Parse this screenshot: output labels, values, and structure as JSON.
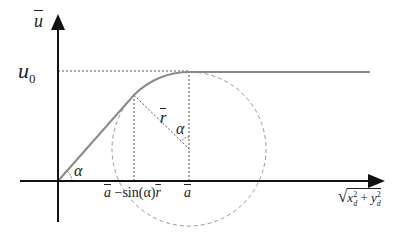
{
  "diagram": {
    "colors": {
      "axis": "#111111",
      "curve": "#8a8a8a",
      "dotted": "#555555",
      "circle": "#9a9a9a",
      "text": "#222222"
    },
    "labels": {
      "y_axis": "u",
      "u0_main": "u",
      "u0_sub": "0",
      "alpha_origin": "α",
      "alpha_center": "α",
      "r_bar": "r",
      "x_tick_left_a": "a",
      "x_tick_left_rest": " −sin(α)",
      "x_tick_left_r": "r",
      "x_tick_right": "a",
      "x_axis_sqrt": "√",
      "x_axis_x": "x",
      "x_axis_x_sup": "2",
      "x_axis_x_sub": "d",
      "x_axis_plus": " + ",
      "x_axis_y": "y",
      "x_axis_y_sup": "2",
      "x_axis_y_sub": "d"
    }
  }
}
